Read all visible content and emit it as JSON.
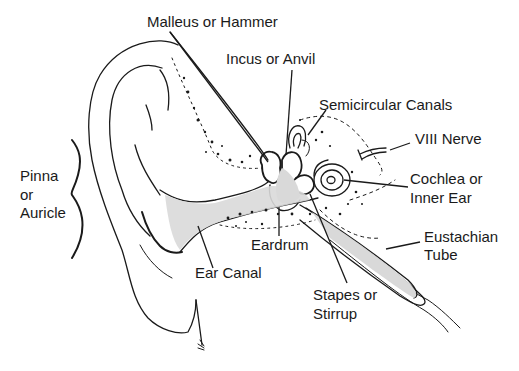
{
  "diagram": {
    "colors": {
      "ink": "#1a1a1a",
      "fill": "#d9d9d9",
      "background": "#ffffff"
    },
    "labels": {
      "malleus": "Malleus or Hammer",
      "incus": "Incus or Anvil",
      "semicircular": "Semicircular Canals",
      "nerve": "VIII Nerve",
      "cochlea_line1": "Cochlea or",
      "cochlea_line2": "Inner Ear",
      "pinna_line1": "Pinna",
      "pinna_line2": "or",
      "pinna_line3": "Auricle",
      "eardrum": "Eardrum",
      "ear_canal": "Ear Canal",
      "stapes_line1": "Stapes or",
      "stapes_line2": "Stirrup",
      "eustachian_line1": "Eustachian",
      "eustachian_line2": "Tube"
    }
  }
}
